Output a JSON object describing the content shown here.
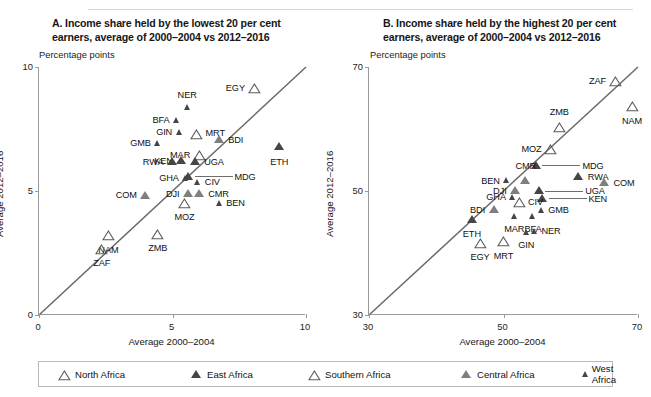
{
  "legend": {
    "items": [
      {
        "label": "North Africa",
        "style": "hollow",
        "size": "normal"
      },
      {
        "label": "East Africa",
        "style": "dark",
        "size": "normal"
      },
      {
        "label": "Southern Africa",
        "style": "hollow",
        "size": "normal"
      },
      {
        "label": "Central Africa",
        "style": "mid",
        "size": "normal"
      },
      {
        "label": "West Africa",
        "style": "dark",
        "size": "small"
      }
    ]
  },
  "chart_data": [
    {
      "type": "scatter",
      "panel": "A",
      "title": "A. Income share held by the lowest 20 per cent earners, average of 2000–2004 vs 2012–2016",
      "units": "Percentage points",
      "xlabel": "Average 2000–2004",
      "ylabel": "Average 2012–2016",
      "xlim": [
        0,
        10
      ],
      "ylim": [
        0,
        10
      ],
      "xticks": [
        0,
        5,
        10
      ],
      "yticks": [
        0,
        5,
        10
      ],
      "grid": false,
      "reference_line": {
        "type": "45-degree",
        "from": [
          0,
          0
        ],
        "to": [
          10,
          10
        ]
      },
      "points": [
        {
          "code": "EGY",
          "x": 8.05,
          "y": 9.15,
          "group": "North Africa",
          "style": "hollow",
          "size": "normal",
          "label_pos": "left"
        },
        {
          "code": "NER",
          "x": 5.55,
          "y": 8.35,
          "group": "West Africa",
          "style": "dark",
          "size": "small",
          "label_pos": "above"
        },
        {
          "code": "BFA",
          "x": 5.15,
          "y": 7.85,
          "group": "West Africa",
          "style": "dark",
          "size": "small",
          "label_pos": "left"
        },
        {
          "code": "GIN",
          "x": 5.25,
          "y": 7.35,
          "group": "West Africa",
          "style": "dark",
          "size": "small",
          "label_pos": "left"
        },
        {
          "code": "MRT",
          "x": 5.9,
          "y": 7.3,
          "group": "North Africa",
          "style": "hollow",
          "size": "normal",
          "label_pos": "right"
        },
        {
          "code": "GMB",
          "x": 4.45,
          "y": 6.9,
          "group": "West Africa",
          "style": "dark",
          "size": "small",
          "label_pos": "left"
        },
        {
          "code": "BDI",
          "x": 6.75,
          "y": 7.05,
          "group": "East Africa",
          "style": "mid",
          "size": "normal",
          "label_pos": "right"
        },
        {
          "code": "ETH",
          "x": 9.0,
          "y": 6.75,
          "group": "East Africa",
          "style": "dark",
          "size": "normal",
          "label_pos": "below"
        },
        {
          "code": "MAR",
          "x": 6.0,
          "y": 6.45,
          "group": "North Africa",
          "style": "hollow",
          "size": "normal",
          "label_pos": "left"
        },
        {
          "code": "KEN",
          "x": 5.35,
          "y": 6.2,
          "group": "East Africa",
          "style": "dark",
          "size": "normal",
          "label_pos": "left"
        },
        {
          "code": "RWA",
          "x": 5.0,
          "y": 6.15,
          "group": "East Africa",
          "style": "dark",
          "size": "normal",
          "label_pos": "left"
        },
        {
          "code": "UGA",
          "x": 5.85,
          "y": 6.15,
          "group": "East Africa",
          "style": "dark",
          "size": "normal",
          "label_pos": "right"
        },
        {
          "code": "MDG",
          "x": 5.6,
          "y": 5.55,
          "group": "East Africa",
          "style": "dark",
          "size": "normal",
          "label_pos": "leader-right"
        },
        {
          "code": "GHA",
          "x": 5.5,
          "y": 5.5,
          "group": "West Africa",
          "style": "dark",
          "size": "small",
          "label_pos": "left"
        },
        {
          "code": "CIV",
          "x": 5.95,
          "y": 5.35,
          "group": "West Africa",
          "style": "dark",
          "size": "small",
          "label_pos": "right"
        },
        {
          "code": "DJI",
          "x": 5.6,
          "y": 4.85,
          "group": "East Africa",
          "style": "mid",
          "size": "normal",
          "label_pos": "left"
        },
        {
          "code": "CMR",
          "x": 6.0,
          "y": 4.85,
          "group": "Central Africa",
          "style": "mid",
          "size": "normal",
          "label_pos": "right"
        },
        {
          "code": "COM",
          "x": 4.0,
          "y": 4.8,
          "group": "East Africa",
          "style": "mid",
          "size": "normal",
          "label_pos": "left"
        },
        {
          "code": "MOZ",
          "x": 5.45,
          "y": 4.5,
          "group": "Southern Africa",
          "style": "hollow",
          "size": "normal",
          "label_pos": "below"
        },
        {
          "code": "BEN",
          "x": 6.75,
          "y": 4.5,
          "group": "West Africa",
          "style": "dark",
          "size": "small",
          "label_pos": "right"
        },
        {
          "code": "NAM",
          "x": 2.6,
          "y": 3.2,
          "group": "Southern Africa",
          "style": "hollow",
          "size": "normal",
          "label_pos": "below"
        },
        {
          "code": "ZMB",
          "x": 4.45,
          "y": 3.25,
          "group": "Southern Africa",
          "style": "hollow",
          "size": "normal",
          "label_pos": "below"
        },
        {
          "code": "ZAF",
          "x": 2.35,
          "y": 2.65,
          "group": "Southern Africa",
          "style": "hollow",
          "size": "normal",
          "label_pos": "below"
        }
      ]
    },
    {
      "type": "scatter",
      "panel": "B",
      "title": "B. Income share held by the highest 20 per cent earners, average of 2000–2004 vs 2012–2016",
      "units": "Percentage points",
      "xlabel": "Average 2000–2004",
      "ylabel": "Average 2012–2016",
      "xlim": [
        30,
        70
      ],
      "ylim": [
        30,
        70
      ],
      "xticks": [
        30,
        50,
        70
      ],
      "yticks": [
        30,
        50,
        70
      ],
      "grid": false,
      "reference_line": {
        "type": "45-degree",
        "from": [
          30,
          30
        ],
        "to": [
          70,
          70
        ]
      },
      "points": [
        {
          "code": "ZAF",
          "x": 66.6,
          "y": 67.6,
          "group": "Southern Africa",
          "style": "hollow",
          "size": "normal",
          "label_pos": "left"
        },
        {
          "code": "NAM",
          "x": 69.1,
          "y": 63.6,
          "group": "Southern Africa",
          "style": "hollow",
          "size": "normal",
          "label_pos": "below"
        },
        {
          "code": "ZMB",
          "x": 58.3,
          "y": 60.3,
          "group": "Southern Africa",
          "style": "hollow",
          "size": "normal",
          "label_pos": "above"
        },
        {
          "code": "MOZ",
          "x": 57.0,
          "y": 56.7,
          "group": "Southern Africa",
          "style": "hollow",
          "size": "normal",
          "label_pos": "left"
        },
        {
          "code": "MDG",
          "x": 54.9,
          "y": 54.0,
          "group": "East Africa",
          "style": "dark",
          "size": "normal",
          "label_pos": "leader-right"
        },
        {
          "code": "RWA",
          "x": 61.2,
          "y": 52.2,
          "group": "East Africa",
          "style": "dark",
          "size": "normal",
          "label_pos": "right"
        },
        {
          "code": "COM",
          "x": 65.0,
          "y": 51.2,
          "group": "East Africa",
          "style": "mid",
          "size": "normal",
          "label_pos": "right"
        },
        {
          "code": "BEN",
          "x": 50.5,
          "y": 51.6,
          "group": "West Africa",
          "style": "dark",
          "size": "small",
          "label_pos": "left"
        },
        {
          "code": "CMR",
          "x": 53.3,
          "y": 51.6,
          "group": "Central Africa",
          "style": "mid",
          "size": "normal",
          "label_pos": "above"
        },
        {
          "code": "DJI",
          "x": 51.8,
          "y": 49.9,
          "group": "East Africa",
          "style": "mid",
          "size": "normal",
          "label_pos": "left"
        },
        {
          "code": "UGA",
          "x": 55.3,
          "y": 49.9,
          "group": "East Africa",
          "style": "dark",
          "size": "normal",
          "label_pos": "leader-right"
        },
        {
          "code": "KEN",
          "x": 55.8,
          "y": 48.7,
          "group": "East Africa",
          "style": "dark",
          "size": "normal",
          "label_pos": "leader-right"
        },
        {
          "code": "GHA",
          "x": 51.4,
          "y": 48.9,
          "group": "West Africa",
          "style": "dark",
          "size": "small",
          "label_pos": "left"
        },
        {
          "code": "CIV",
          "x": 52.3,
          "y": 48.2,
          "group": "West Africa",
          "style": "hollow",
          "size": "normal",
          "label_pos": "right"
        },
        {
          "code": "BDI",
          "x": 48.6,
          "y": 46.9,
          "group": "East Africa",
          "style": "mid",
          "size": "normal",
          "label_pos": "left"
        },
        {
          "code": "GMB",
          "x": 55.6,
          "y": 46.9,
          "group": "West Africa",
          "style": "dark",
          "size": "small",
          "label_pos": "right"
        },
        {
          "code": "ETH",
          "x": 45.3,
          "y": 45.3,
          "group": "East Africa",
          "style": "dark",
          "size": "normal",
          "label_pos": "below"
        },
        {
          "code": "MAR",
          "x": 51.6,
          "y": 45.8,
          "group": "North Africa",
          "style": "dark",
          "size": "small",
          "label_pos": "below"
        },
        {
          "code": "BFA",
          "x": 54.4,
          "y": 45.8,
          "group": "West Africa",
          "style": "dark",
          "size": "small",
          "label_pos": "below"
        },
        {
          "code": "GIN",
          "x": 53.4,
          "y": 43.3,
          "group": "West Africa",
          "style": "dark",
          "size": "small",
          "label_pos": "below"
        },
        {
          "code": "NER",
          "x": 54.6,
          "y": 43.5,
          "group": "West Africa",
          "style": "dark",
          "size": "small",
          "label_pos": "right"
        },
        {
          "code": "EGY",
          "x": 46.5,
          "y": 41.6,
          "group": "North Africa",
          "style": "hollow",
          "size": "normal",
          "label_pos": "below"
        },
        {
          "code": "MRT",
          "x": 50.0,
          "y": 41.8,
          "group": "North Africa",
          "style": "hollow",
          "size": "normal",
          "label_pos": "below"
        }
      ]
    }
  ]
}
